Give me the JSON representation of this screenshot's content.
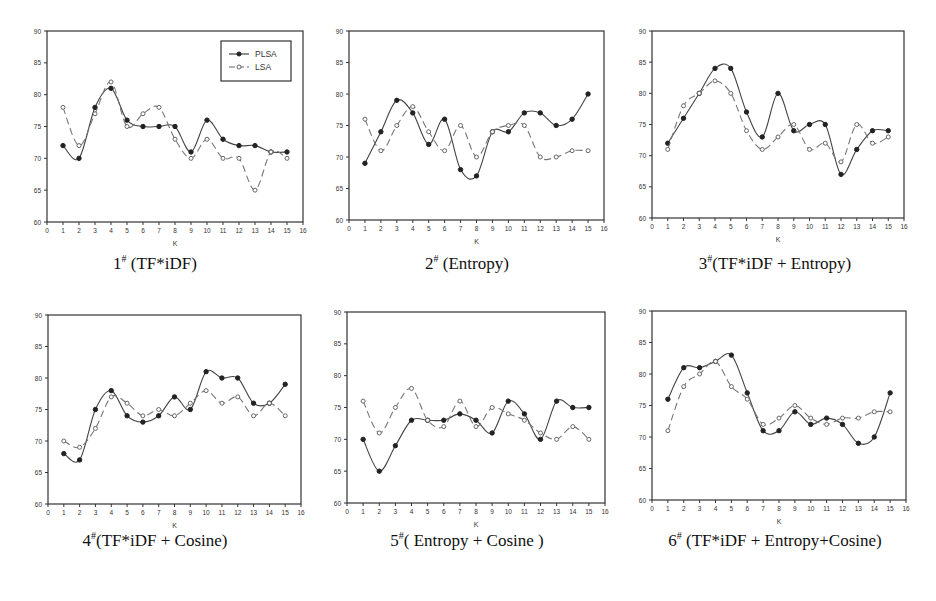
{
  "figure": {
    "legend": {
      "series": [
        "PLSA",
        "LSA"
      ],
      "placement": "top-right",
      "shown_in_panel": 0
    }
  },
  "chart_data": [
    {
      "type": "line",
      "caption_num": "1",
      "caption_sup": "#",
      "caption_text": " (TF*iDF)",
      "xlabel": "K",
      "ylabel": "",
      "xlim": [
        0,
        16
      ],
      "ylim": [
        60,
        90
      ],
      "xticks": [
        "0",
        "1",
        "2",
        "3",
        "4",
        "5",
        "6",
        "7",
        "8",
        "9",
        "10",
        "11",
        "12",
        "13",
        "14",
        "15",
        "16"
      ],
      "yticks": [
        "60",
        "65",
        "70",
        "75",
        "80",
        "85",
        "90"
      ],
      "x": [
        1,
        2,
        3,
        4,
        5,
        6,
        7,
        8,
        9,
        10,
        11,
        12,
        13,
        14,
        15
      ],
      "series": [
        {
          "name": "PLSA",
          "style": "solid-filled-dot",
          "values": [
            72,
            70,
            78,
            81,
            76,
            75,
            75,
            75,
            71,
            76,
            73,
            72,
            72,
            71,
            71
          ]
        },
        {
          "name": "LSA",
          "style": "dashed-open-dot",
          "values": [
            78,
            72,
            77,
            82,
            75,
            77,
            78,
            73,
            70,
            73,
            70,
            70,
            65,
            71,
            70
          ]
        }
      ]
    },
    {
      "type": "line",
      "caption_num": "2",
      "caption_sup": "#",
      "caption_text": " (Entropy)",
      "xlabel": "K",
      "ylabel": "",
      "xlim": [
        0,
        16
      ],
      "ylim": [
        60,
        90
      ],
      "xticks": [
        "0",
        "1",
        "2",
        "3",
        "4",
        "5",
        "6",
        "7",
        "8",
        "9",
        "10",
        "11",
        "12",
        "13",
        "14",
        "15",
        "16"
      ],
      "yticks": [
        "60",
        "65",
        "70",
        "75",
        "80",
        "85",
        "90"
      ],
      "x": [
        1,
        2,
        3,
        4,
        5,
        6,
        7,
        8,
        9,
        10,
        11,
        12,
        13,
        14,
        15
      ],
      "series": [
        {
          "name": "PLSA",
          "style": "solid-filled-dot",
          "values": [
            69,
            74,
            79,
            77,
            72,
            76,
            68,
            67,
            74,
            74,
            77,
            77,
            75,
            76,
            80
          ]
        },
        {
          "name": "LSA",
          "style": "dashed-open-dot",
          "values": [
            76,
            71,
            75,
            78,
            74,
            71,
            75,
            70,
            74,
            75,
            75,
            70,
            70,
            71,
            71
          ]
        }
      ]
    },
    {
      "type": "line",
      "caption_num": "3",
      "caption_sup": "#",
      "caption_text": "(TF*iDF + Entropy)",
      "xlabel": "K",
      "ylabel": "",
      "xlim": [
        0,
        16
      ],
      "ylim": [
        60,
        90
      ],
      "xticks": [
        "0",
        "1",
        "2",
        "3",
        "4",
        "5",
        "6",
        "7",
        "8",
        "9",
        "10",
        "11",
        "12",
        "13",
        "14",
        "15",
        "16"
      ],
      "yticks": [
        "60",
        "65",
        "70",
        "75",
        "80",
        "85",
        "90"
      ],
      "x": [
        1,
        2,
        3,
        4,
        5,
        6,
        7,
        8,
        9,
        10,
        11,
        12,
        13,
        14,
        15
      ],
      "series": [
        {
          "name": "PLSA",
          "style": "solid-filled-dot",
          "values": [
            72,
            76,
            80,
            84,
            84,
            77,
            73,
            80,
            74,
            75,
            75,
            67,
            71,
            74,
            74
          ]
        },
        {
          "name": "LSA",
          "style": "dashed-open-dot",
          "values": [
            71,
            78,
            80,
            82,
            80,
            74,
            71,
            73,
            75,
            71,
            72,
            69,
            75,
            72,
            73
          ]
        }
      ]
    },
    {
      "type": "line",
      "caption_num": "4",
      "caption_sup": "#",
      "caption_text": "(TF*iDF + Cosine)",
      "xlabel": "K",
      "ylabel": "",
      "xlim": [
        0,
        16
      ],
      "ylim": [
        60,
        90
      ],
      "xticks": [
        "0",
        "1",
        "2",
        "3",
        "4",
        "5",
        "6",
        "7",
        "8",
        "9",
        "10",
        "11",
        "12",
        "13",
        "14",
        "15",
        "16"
      ],
      "yticks": [
        "60",
        "65",
        "70",
        "75",
        "80",
        "85",
        "90"
      ],
      "x": [
        1,
        2,
        3,
        4,
        5,
        6,
        7,
        8,
        9,
        10,
        11,
        12,
        13,
        14,
        15
      ],
      "series": [
        {
          "name": "PLSA",
          "style": "solid-filled-dot",
          "values": [
            68,
            67,
            75,
            78,
            74,
            73,
            74,
            77,
            75,
            81,
            80,
            80,
            76,
            76,
            79
          ]
        },
        {
          "name": "LSA",
          "style": "dashed-open-dot",
          "values": [
            70,
            69,
            72,
            77,
            76,
            74,
            75,
            74,
            76,
            78,
            76,
            77,
            74,
            76,
            74
          ]
        }
      ]
    },
    {
      "type": "line",
      "caption_num": "5",
      "caption_sup": "#",
      "caption_text": "( Entropy + Cosine )",
      "xlabel": "K",
      "ylabel": "",
      "xlim": [
        0,
        16
      ],
      "ylim": [
        60,
        90
      ],
      "xticks": [
        "0",
        "1",
        "2",
        "3",
        "4",
        "5",
        "6",
        "7",
        "8",
        "9",
        "10",
        "11",
        "12",
        "13",
        "14",
        "15",
        "16"
      ],
      "yticks": [
        "60",
        "65",
        "70",
        "75",
        "80",
        "85",
        "90"
      ],
      "x": [
        1,
        2,
        3,
        4,
        5,
        6,
        7,
        8,
        9,
        10,
        11,
        12,
        13,
        14,
        15
      ],
      "series": [
        {
          "name": "PLSA",
          "style": "solid-filled-dot",
          "values": [
            70,
            65,
            69,
            73,
            73,
            73,
            74,
            73,
            71,
            76,
            74,
            70,
            76,
            75,
            75
          ]
        },
        {
          "name": "LSA",
          "style": "dashed-open-dot",
          "values": [
            76,
            71,
            75,
            78,
            73,
            72,
            76,
            72,
            75,
            74,
            73,
            71,
            70,
            72,
            70
          ]
        }
      ]
    },
    {
      "type": "line",
      "caption_num": "6",
      "caption_sup": "#",
      "caption_text": " (TF*iDF + Entropy+Cosine)",
      "xlabel": "K",
      "ylabel": "",
      "xlim": [
        0,
        16
      ],
      "ylim": [
        60,
        90
      ],
      "xticks": [
        "0",
        "1",
        "2",
        "3",
        "4",
        "5",
        "6",
        "7",
        "8",
        "9",
        "10",
        "11",
        "12",
        "13",
        "14",
        "15",
        "16"
      ],
      "yticks": [
        "60",
        "65",
        "70",
        "75",
        "80",
        "85",
        "90"
      ],
      "x": [
        1,
        2,
        3,
        4,
        5,
        6,
        7,
        8,
        9,
        10,
        11,
        12,
        13,
        14,
        15
      ],
      "series": [
        {
          "name": "PLSA",
          "style": "solid-filled-dot",
          "values": [
            76,
            81,
            81,
            82,
            83,
            77,
            71,
            71,
            74,
            72,
            73,
            72,
            69,
            70,
            77
          ]
        },
        {
          "name": "LSA",
          "style": "dashed-open-dot",
          "values": [
            71,
            78,
            80,
            82,
            78,
            76,
            72,
            73,
            75,
            73,
            72,
            73,
            73,
            74,
            74
          ]
        }
      ]
    }
  ]
}
